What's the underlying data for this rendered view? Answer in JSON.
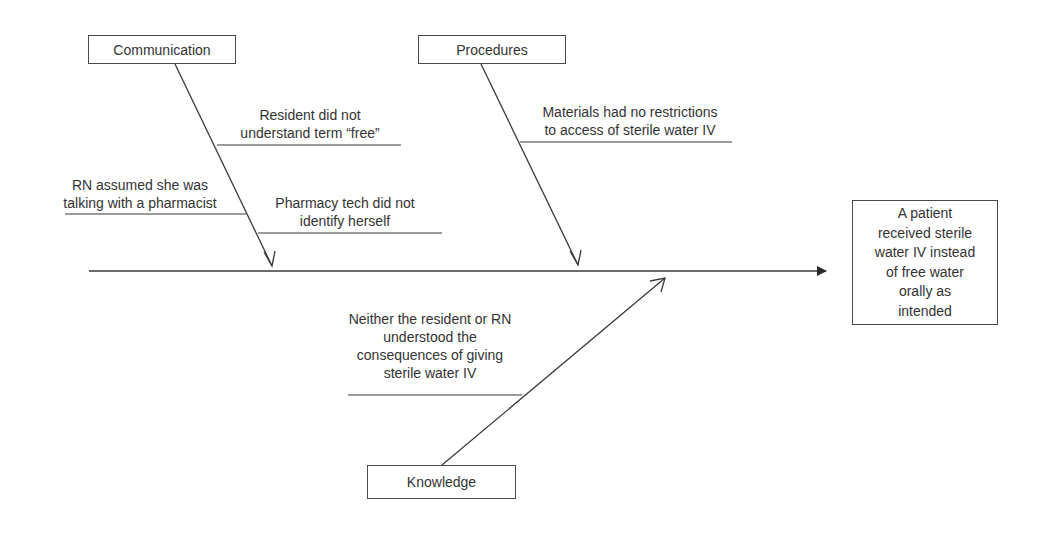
{
  "diagram": {
    "type": "fishbone",
    "effect": {
      "text": "A patient\nreceived sterile\nwater IV instead\nof free water\norally as\nintended"
    },
    "categories": [
      {
        "name": "Communication",
        "causes": [
          "Resident did not\nunderstand term “free”",
          "RN assumed she was\ntalking with a pharmacist",
          "Pharmacy tech did not\nidentify herself"
        ]
      },
      {
        "name": "Procedures",
        "causes": [
          "Materials had no restrictions\nto access of sterile water IV"
        ]
      },
      {
        "name": "Knowledge",
        "causes": [
          "Neither the resident or RN\nunderstood the\nconsequences of giving\nsterile water IV"
        ]
      }
    ],
    "colors": {
      "line": "#3a3a3a",
      "text": "#333333",
      "background": "#ffffff"
    }
  }
}
